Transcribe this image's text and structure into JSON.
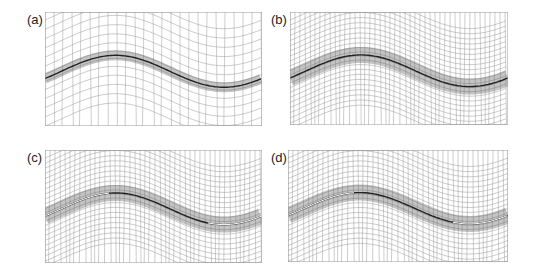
{
  "figure": {
    "panels": [
      {
        "id": "a",
        "label": "(a)",
        "x": 45,
        "y": 12,
        "w": 217,
        "h": 114,
        "density": "coarse",
        "crack_visible": false
      },
      {
        "id": "b",
        "label": "(b)",
        "x": 290,
        "y": 12,
        "w": 218,
        "h": 113,
        "density": "fine",
        "crack_visible": false
      },
      {
        "id": "c",
        "label": "(c)",
        "x": 45,
        "y": 150,
        "w": 217,
        "h": 113,
        "density": "fine",
        "crack_visible": true
      },
      {
        "id": "d",
        "label": "(d)",
        "x": 288,
        "y": 150,
        "w": 220,
        "h": 112,
        "density": "fine",
        "crack_visible": true
      }
    ],
    "colors": {
      "mesh": "#9a9a9a",
      "band": "#555555",
      "interface": "#222222",
      "crack": "#ffffff"
    }
  }
}
